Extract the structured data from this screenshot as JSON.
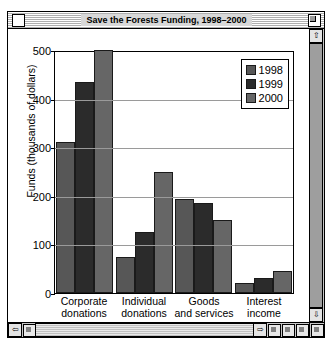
{
  "window": {
    "title": "Save the Forests Funding, 1998–2000",
    "close_box": "close-box",
    "zoom_box": "zoom-box",
    "scroll_up": "⇧",
    "scroll_down": "⇩",
    "scroll_left": "⇦",
    "scroll_right": "⇨"
  },
  "chart_data": {
    "type": "bar",
    "title": "Save the Forests Funding, 1998–2000",
    "xlabel": "",
    "ylabel": "Funds (thousands of dollars)",
    "ylim": [
      0,
      500
    ],
    "yticks": [
      0,
      100,
      200,
      300,
      400,
      500
    ],
    "grid": true,
    "legend_position": "top-right",
    "categories": [
      "Corporate donations",
      "Individual donations",
      "Goods and services",
      "Interest income"
    ],
    "series": [
      {
        "name": "1998",
        "color": "#575757",
        "values": [
          310,
          75,
          193,
          20
        ]
      },
      {
        "name": "1999",
        "color": "#2b2b2b",
        "values": [
          435,
          125,
          185,
          30
        ]
      },
      {
        "name": "2000",
        "color": "#666666",
        "values": [
          500,
          248,
          150,
          45
        ]
      }
    ]
  }
}
